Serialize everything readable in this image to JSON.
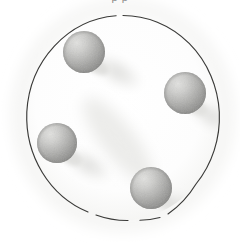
{
  "figure": {
    "medium": "pencil-halftone-grayscale",
    "background_color": "#ffffff",
    "cropped_caption_above": "p        p",
    "canvas": {
      "width": 240,
      "height": 243
    },
    "dish": {
      "name": "outer-circle",
      "center_x": 123,
      "center_y": 118,
      "radius_x": 97,
      "radius_y": 103,
      "stroke_color": "#3a3a38",
      "stroke_width": 1.1,
      "fill_color": "#fdfdfd",
      "label": "circular dish outline"
    },
    "spheres": [
      {
        "id": "sphere-top-left",
        "label": "top-left sphere",
        "cx": 84,
        "cy": 52,
        "r": 21,
        "highlight_color": "#d8d8d6",
        "mid_color": "#b0b0ae",
        "shade_color": "#8e8e8c",
        "light_from": "upper-left"
      },
      {
        "id": "sphere-right",
        "label": "right sphere",
        "cx": 185,
        "cy": 93,
        "r": 21,
        "highlight_color": "#d8d8d6",
        "mid_color": "#b0b0ae",
        "shade_color": "#8e8e8c",
        "light_from": "upper-left"
      },
      {
        "id": "sphere-left",
        "label": "left sphere",
        "cx": 57,
        "cy": 143,
        "r": 20,
        "highlight_color": "#d8d8d6",
        "mid_color": "#b0b0ae",
        "shade_color": "#8e8e8c",
        "light_from": "upper-left"
      },
      {
        "id": "sphere-bottom",
        "label": "bottom sphere",
        "cx": 151,
        "cy": 188,
        "r": 21,
        "highlight_color": "#d8d8d6",
        "mid_color": "#b0b0ae",
        "shade_color": "#8e8e8c",
        "light_from": "upper-left"
      }
    ],
    "shadows": [
      {
        "id": "shadow-top-left",
        "label": "cast shadow of top-left sphere",
        "cx": 117,
        "cy": 72,
        "rx": 30,
        "ry": 15,
        "rotate": 30,
        "color": "#e6e6e4"
      },
      {
        "id": "shadow-right",
        "label": "cast shadow of right sphere",
        "cx": 212,
        "cy": 116,
        "rx": 26,
        "ry": 14,
        "rotate": 30,
        "color": "#e9e9e7"
      },
      {
        "id": "shadow-left",
        "label": "cast shadow of left sphere",
        "cx": 88,
        "cy": 165,
        "rx": 28,
        "ry": 14,
        "rotate": 30,
        "color": "#e8e8e6"
      },
      {
        "id": "shadow-bottom",
        "label": "cast shadow of bottom sphere",
        "cx": 181,
        "cy": 208,
        "rx": 26,
        "ry": 14,
        "rotate": 30,
        "color": "#ebebe9"
      },
      {
        "id": "shadow-diagonal-band",
        "label": "faint diagonal shadow band across center",
        "cx": 118,
        "cy": 140,
        "rx": 52,
        "ry": 17,
        "rotate": 52,
        "color": "#eeeeec"
      }
    ]
  }
}
